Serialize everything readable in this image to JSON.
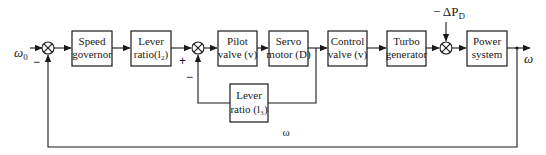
{
  "diagram": {
    "input": {
      "symbol": "ω",
      "subscript": "0"
    },
    "output": {
      "symbol": "ω"
    },
    "feedback_label": "ω",
    "disturbance": {
      "prefix": "− ΔP",
      "subscript": "D"
    },
    "blocks": [
      {
        "id": "speed-governor",
        "line1": "Speed",
        "line2": "governor"
      },
      {
        "id": "lever-ratio-l2",
        "line1": "Lever",
        "line2": "ratio(l₂)"
      },
      {
        "id": "pilot-valve",
        "line1": "Pilot",
        "line2": "valve (v)"
      },
      {
        "id": "servo-motor",
        "line1": "Servo",
        "line2": "motor (D)"
      },
      {
        "id": "control-valve",
        "line1": "Control",
        "line2": "valve (v)"
      },
      {
        "id": "turbo-generator",
        "line1": "Turbo",
        "line2": "generator"
      },
      {
        "id": "power-system",
        "line1": "Power",
        "line2": "system"
      },
      {
        "id": "lever-ratio-l3",
        "line1": "Lever",
        "line2": "ratio (l₃)"
      }
    ],
    "summing_junctions": [
      {
        "id": "sum-1",
        "signs": [
          "−"
        ]
      },
      {
        "id": "sum-2",
        "signs": [
          "+",
          "−"
        ]
      },
      {
        "id": "sum-3",
        "signs": []
      }
    ]
  }
}
